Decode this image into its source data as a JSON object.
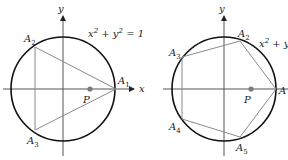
{
  "figures": [
    {
      "id": "triangle",
      "circle": {
        "cx": 63,
        "cy": 89,
        "r": 52
      },
      "equation": "x² + y² = 1",
      "axes": {
        "x_label": "x",
        "y_label": "y"
      },
      "point": {
        "label": "P",
        "x": 90,
        "y": 89
      },
      "polygon": [
        {
          "label": "A",
          "sub": "1",
          "x": 116,
          "y": 89
        },
        {
          "label": "A",
          "sub": "2",
          "x": 35,
          "y": 47
        },
        {
          "label": "A",
          "sub": "3",
          "x": 35,
          "y": 130
        }
      ]
    },
    {
      "id": "pentagon",
      "circle": {
        "cx": 224,
        "cy": 89,
        "r": 52
      },
      "equation": "x² + y",
      "axes": {
        "x_label": "x",
        "y_label": "y"
      },
      "point": {
        "label": "P",
        "x": 251,
        "y": 89
      },
      "polygon": [
        {
          "label": "A",
          "sub": "",
          "x": 276,
          "y": 89
        },
        {
          "label": "A",
          "sub": "2",
          "x": 240,
          "y": 41
        },
        {
          "label": "A",
          "sub": "3",
          "x": 182,
          "y": 57
        },
        {
          "label": "A",
          "sub": "4",
          "x": 182,
          "y": 119
        },
        {
          "label": "A",
          "sub": "5",
          "x": 240,
          "y": 137
        }
      ]
    }
  ],
  "colors": {
    "circle": "#111111",
    "polygon": "#8a8a8a",
    "axis": "#555555",
    "point": "#7a7a7a"
  }
}
